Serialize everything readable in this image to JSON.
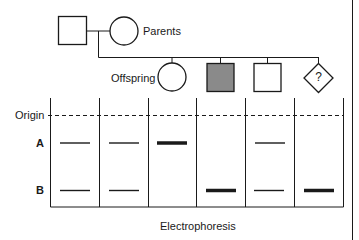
{
  "pedigree": {
    "parents_label": "Parents",
    "offspring_label": "Offspring",
    "parents": [
      {
        "sex": "male",
        "shape": "square",
        "affected": false
      },
      {
        "sex": "female",
        "shape": "circle",
        "affected": false
      }
    ],
    "offspring": [
      {
        "sex": "female",
        "shape": "circle",
        "affected": false
      },
      {
        "sex": "male",
        "shape": "square",
        "affected": true
      },
      {
        "sex": "male",
        "shape": "square",
        "affected": false
      },
      {
        "sex": "unknown",
        "shape": "diamond",
        "affected": false,
        "symbol": "?"
      }
    ],
    "colors": {
      "affected_fill": "#8a8a8a",
      "line": "#1a1a1a"
    }
  },
  "gel": {
    "origin_label": "Origin",
    "band_labels": [
      "A",
      "B"
    ],
    "caption": "Electrophoresis",
    "lanes": [
      {
        "individual": "father",
        "A": "thin",
        "B": "thin"
      },
      {
        "individual": "mother",
        "A": "thin",
        "B": "thin"
      },
      {
        "individual": "offspring-1",
        "A": "thick",
        "B": "none"
      },
      {
        "individual": "offspring-2",
        "A": "none",
        "B": "thick"
      },
      {
        "individual": "offspring-3",
        "A": "thin",
        "B": "thin"
      },
      {
        "individual": "offspring-4",
        "A": "none",
        "B": "thick"
      }
    ]
  }
}
